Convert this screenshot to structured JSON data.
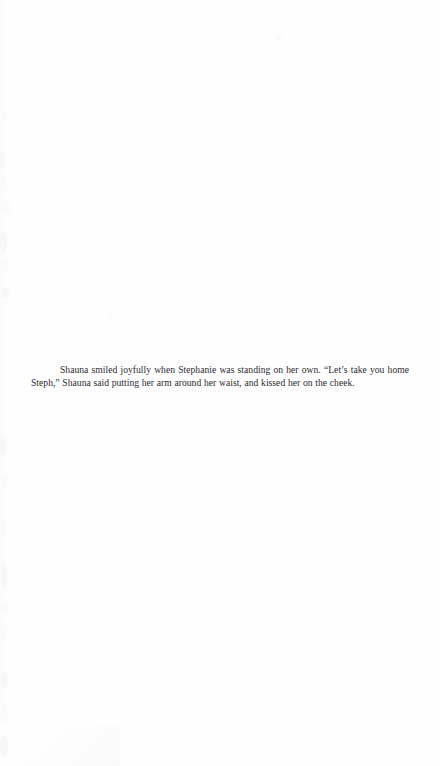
{
  "page": {
    "kind": "scanned-book-page",
    "width": 440,
    "height": 766,
    "background_color": "#fefefe",
    "text_color": "#2b2b30"
  },
  "body": {
    "paragraph": "Shauna smiled joyfully when Stephanie was standing on her own. “Let’s take you home Steph,” Shauna said putting her arm around her waist, and kissed her on the cheek.",
    "lines": [
      "Shauna smiled joyfully when Stephanie was standing on her own. “Let’s take you home",
      "Steph,” Shauna said putting her arm around her waist, and kissed her on the cheek."
    ]
  },
  "artifacts": {
    "description": "faint grayscale scanner speckles along the left edge of the scan",
    "specks": [
      {
        "x": 2,
        "y": 112,
        "w": 5,
        "h": 9,
        "tone": "faint"
      },
      {
        "x": 0,
        "y": 152,
        "w": 6,
        "h": 16,
        "tone": "soft"
      },
      {
        "x": 1,
        "y": 176,
        "w": 5,
        "h": 12,
        "tone": "faint"
      },
      {
        "x": 3,
        "y": 206,
        "w": 8,
        "h": 5,
        "tone": "faint"
      },
      {
        "x": 0,
        "y": 232,
        "w": 7,
        "h": 20,
        "tone": "soft"
      },
      {
        "x": 2,
        "y": 258,
        "w": 6,
        "h": 14,
        "tone": "faint"
      },
      {
        "x": 1,
        "y": 288,
        "w": 8,
        "h": 10,
        "tone": "soft"
      },
      {
        "x": 108,
        "y": 315,
        "w": 6,
        "h": 4,
        "tone": "faint"
      },
      {
        "x": 277,
        "y": 36,
        "w": 5,
        "h": 4,
        "tone": "faint"
      },
      {
        "x": 0,
        "y": 438,
        "w": 6,
        "h": 18,
        "tone": "soft"
      },
      {
        "x": 2,
        "y": 476,
        "w": 5,
        "h": 10,
        "tone": "faint"
      },
      {
        "x": 0,
        "y": 520,
        "w": 7,
        "h": 15,
        "tone": "faint"
      },
      {
        "x": 1,
        "y": 566,
        "w": 6,
        "h": 22,
        "tone": "soft"
      },
      {
        "x": 3,
        "y": 604,
        "w": 5,
        "h": 9,
        "tone": "faint"
      },
      {
        "x": 0,
        "y": 628,
        "w": 6,
        "h": 12,
        "tone": "faint"
      },
      {
        "x": 1,
        "y": 672,
        "w": 7,
        "h": 16,
        "tone": "soft"
      },
      {
        "x": 2,
        "y": 706,
        "w": 5,
        "h": 11,
        "tone": "faint"
      },
      {
        "x": 0,
        "y": 736,
        "w": 8,
        "h": 20,
        "tone": "soft"
      }
    ]
  }
}
